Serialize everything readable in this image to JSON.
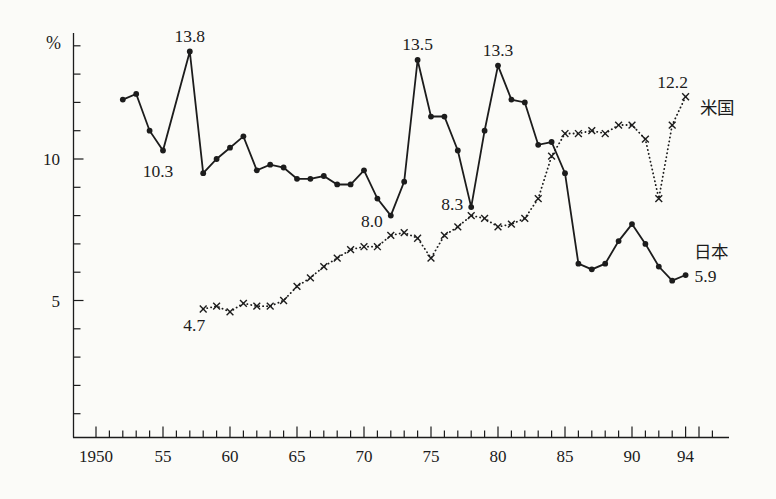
{
  "chart_data": {
    "type": "line",
    "unit_label": "%",
    "ink_color": "#1c1c1c",
    "paper_color": "#fbfbf8",
    "grid": false,
    "ylim": [
      0,
      14.5
    ],
    "ytick_step": 1,
    "yticks_labeled": [
      {
        "value": 5,
        "label": "5"
      },
      {
        "value": 10,
        "label": "10"
      }
    ],
    "xlim": [
      1950,
      1996
    ],
    "xtick_step": 1,
    "xticks_labeled": [
      {
        "year": 1950,
        "label": "1950"
      },
      {
        "year": 1955,
        "label": "55"
      },
      {
        "year": 1960,
        "label": "60"
      },
      {
        "year": 1965,
        "label": "65"
      },
      {
        "year": 1970,
        "label": "70"
      },
      {
        "year": 1975,
        "label": "75"
      },
      {
        "year": 1980,
        "label": "80"
      },
      {
        "year": 1985,
        "label": "85"
      },
      {
        "year": 1990,
        "label": "90"
      },
      {
        "year": 1994,
        "label": "94"
      }
    ],
    "legend_position": "end-of-line-labels",
    "series": [
      {
        "id": "japan",
        "name": "日本",
        "line_style": "solid",
        "marker": "dot",
        "x": [
          1952,
          1953,
          1954,
          1955,
          1957,
          1958,
          1959,
          1960,
          1961,
          1962,
          1963,
          1964,
          1965,
          1966,
          1967,
          1968,
          1969,
          1970,
          1971,
          1972,
          1973,
          1974,
          1975,
          1976,
          1977,
          1978,
          1979,
          1980,
          1981,
          1982,
          1983,
          1984,
          1985,
          1986,
          1987,
          1988,
          1989,
          1990,
          1991,
          1992,
          1993,
          1994
        ],
        "y": [
          12.1,
          12.3,
          11.0,
          10.3,
          13.8,
          9.5,
          10.0,
          10.4,
          10.8,
          9.6,
          9.8,
          9.7,
          9.3,
          9.3,
          9.4,
          9.1,
          9.1,
          9.6,
          8.6,
          8.0,
          9.2,
          13.5,
          11.5,
          11.5,
          10.3,
          8.3,
          11.0,
          13.3,
          12.1,
          12.0,
          10.5,
          10.6,
          9.5,
          6.3,
          6.1,
          6.3,
          7.1,
          7.7,
          7.0,
          6.2,
          5.7,
          5.9
        ]
      },
      {
        "id": "us",
        "name": "米国",
        "line_style": "dotted",
        "marker": "x",
        "x": [
          1958,
          1959,
          1960,
          1961,
          1962,
          1963,
          1964,
          1965,
          1966,
          1967,
          1968,
          1969,
          1970,
          1971,
          1972,
          1973,
          1974,
          1975,
          1976,
          1977,
          1978,
          1979,
          1980,
          1981,
          1982,
          1983,
          1984,
          1985,
          1986,
          1987,
          1988,
          1989,
          1990,
          1991,
          1992,
          1993,
          1994
        ],
        "y": [
          4.7,
          4.8,
          4.6,
          4.9,
          4.8,
          4.8,
          5.0,
          5.5,
          5.8,
          6.2,
          6.5,
          6.8,
          6.9,
          6.9,
          7.3,
          7.4,
          7.2,
          6.5,
          7.3,
          7.6,
          8.0,
          7.9,
          7.6,
          7.7,
          7.9,
          8.6,
          10.1,
          10.9,
          10.9,
          11.0,
          10.9,
          11.2,
          11.2,
          10.7,
          8.6,
          11.2,
          12.2
        ]
      }
    ],
    "annotations": [
      {
        "text": "13.8",
        "series": "japan",
        "year": 1957,
        "value": 13.8,
        "placement": "above"
      },
      {
        "text": "10.3",
        "series": "japan",
        "year": 1955,
        "value": 10.3,
        "placement": "below"
      },
      {
        "text": "13.5",
        "series": "japan",
        "year": 1974,
        "value": 13.5,
        "placement": "above"
      },
      {
        "text": "13.3",
        "series": "japan",
        "year": 1980,
        "value": 13.3,
        "placement": "above"
      },
      {
        "text": "8.0",
        "series": "japan",
        "year": 1972,
        "value": 8.0,
        "placement": "left-below"
      },
      {
        "text": "8.3",
        "series": "japan",
        "year": 1978,
        "value": 8.3,
        "placement": "left"
      },
      {
        "text": "4.7",
        "series": "us",
        "year": 1958,
        "value": 4.7,
        "placement": "below-left"
      },
      {
        "text": "12.2",
        "series": "us",
        "year": 1994,
        "value": 12.2,
        "placement": "above-left"
      },
      {
        "text": "米国",
        "series": "us",
        "year": 1994,
        "value": 12.2,
        "placement": "right-below",
        "role": "series-label-us",
        "cjk": true
      },
      {
        "text": "日本",
        "series": "japan",
        "year": 1994,
        "value": 5.9,
        "placement": "right-above",
        "role": "series-label-japan",
        "cjk": true
      },
      {
        "text": "5.9",
        "series": "japan",
        "year": 1994,
        "value": 5.9,
        "placement": "right",
        "role": "end-value-label"
      }
    ]
  }
}
